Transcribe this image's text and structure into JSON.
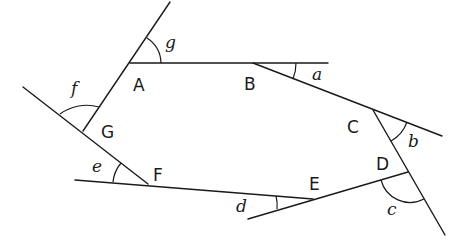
{
  "diagram": {
    "vertices": [
      {
        "id": "A",
        "label": "A",
        "x": 130,
        "y": 63,
        "lx": 133,
        "ly": 91
      },
      {
        "id": "B",
        "label": "B",
        "x": 253,
        "y": 63,
        "lx": 244,
        "ly": 90
      },
      {
        "id": "C",
        "label": "C",
        "x": 373,
        "y": 110,
        "lx": 347,
        "ly": 133
      },
      {
        "id": "D",
        "label": "D",
        "x": 408,
        "y": 172,
        "lx": 377,
        "ly": 170
      },
      {
        "id": "E",
        "label": "E",
        "x": 313,
        "y": 199,
        "lx": 309,
        "ly": 190
      },
      {
        "id": "F",
        "label": "F",
        "x": 148,
        "y": 184,
        "lx": 153,
        "ly": 181
      },
      {
        "id": "G",
        "label": "G",
        "x": 83,
        "y": 131,
        "lx": 101,
        "ly": 138
      }
    ],
    "angles": [
      {
        "id": "a",
        "label": "a",
        "x": 312,
        "y": 80
      },
      {
        "id": "b",
        "label": "b",
        "x": 409,
        "y": 147
      },
      {
        "id": "c",
        "label": "c",
        "x": 388,
        "y": 215
      },
      {
        "id": "d",
        "label": "d",
        "x": 237,
        "y": 212
      },
      {
        "id": "e",
        "label": "e",
        "x": 93,
        "y": 172
      },
      {
        "id": "f",
        "label": "f",
        "x": 73,
        "y": 94
      },
      {
        "id": "g",
        "label": "g",
        "x": 166,
        "y": 48
      }
    ],
    "colors": {
      "stroke": "#1a1a1a",
      "background": "#ffffff"
    }
  }
}
